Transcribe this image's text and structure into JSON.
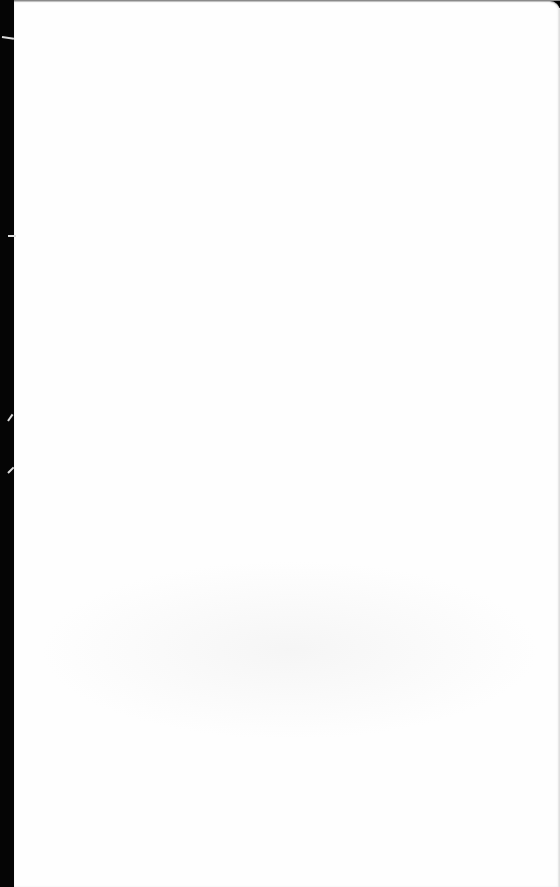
{
  "document": {
    "type": "scanned-blank-page",
    "text": "",
    "colors": {
      "paper": "#fefefe",
      "binding": "#050505",
      "edge": "#d8d8d8"
    }
  }
}
